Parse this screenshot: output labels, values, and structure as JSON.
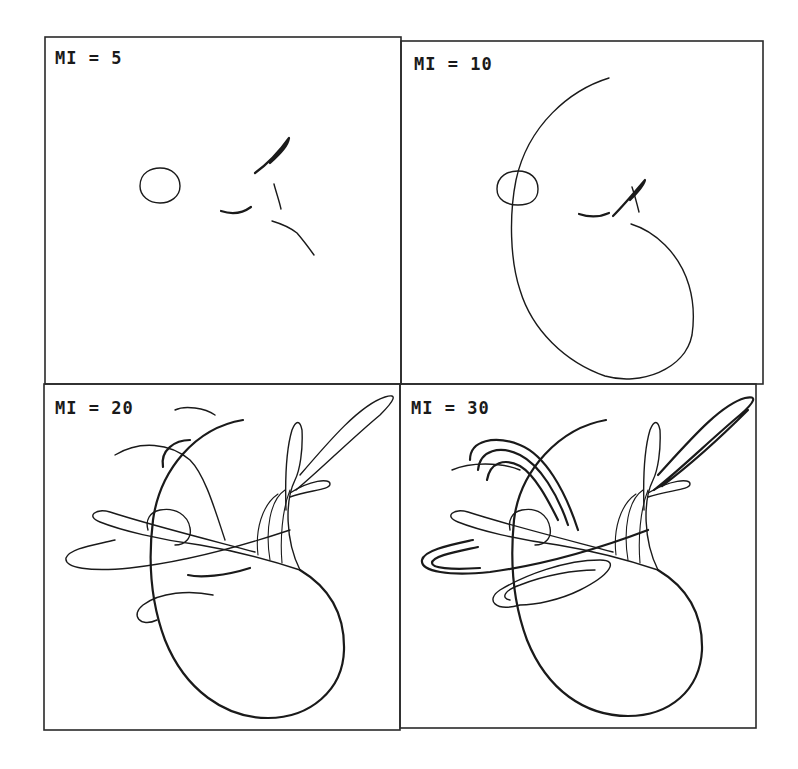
{
  "figure": {
    "background": "#ffffff",
    "ink": "#1a1a1a",
    "grid": {
      "rows": 2,
      "cols": 2
    }
  },
  "panels": [
    {
      "label": "MI = 5",
      "iterations": 5,
      "frame": {
        "x": 45,
        "y": 37,
        "w": 356,
        "h": 347
      },
      "label_pos": {
        "x": 55,
        "y": 64
      },
      "curves": [
        {
          "d": "M140,186 C140,172 152,168 160,168 C172,168 180,176 180,186 C180,197 170,203 160,203 C149,203 140,196 140,186 Z",
          "w": "normal"
        },
        {
          "d": "M255,173 C266,165 279,152 289,138 C288,145 282,152 270,163",
          "w": "thick"
        },
        {
          "d": "M274,184 C276,192 279,200 281,209",
          "w": "normal"
        },
        {
          "d": "M221,211 C230,214 240,215 251,207",
          "w": "thick"
        },
        {
          "d": "M272,221 C282,224 292,229 297,233 C303,240 309,248 314,255",
          "w": "normal"
        }
      ]
    },
    {
      "label": "MI = 10",
      "iterations": 10,
      "frame": {
        "x": 401,
        "y": 41,
        "w": 362,
        "h": 343
      },
      "label_pos": {
        "x": 414,
        "y": 70
      },
      "curves": [
        {
          "d": "M497,189 C497,176 508,171 518,171 C530,171 538,178 538,189 C538,200 530,205 518,205 C507,205 497,200 497,189 Z",
          "w": "normal"
        },
        {
          "d": "M609,78 C570,90 528,125 516,180 C509,215 510,260 520,290 C532,330 565,362 605,376 C640,386 685,370 692,335 C697,300 688,268 665,245 C655,235 644,228 631,224",
          "w": "normal"
        },
        {
          "d": "M613,216 C623,206 634,193 645,180 C644,185 640,190 630,200",
          "w": "thick"
        },
        {
          "d": "M632,187 C635,196 637,204 639,212",
          "w": "normal"
        },
        {
          "d": "M579,214 C588,217 598,218 609,213",
          "w": "thick"
        }
      ]
    },
    {
      "label": "MI = 20",
      "iterations": 20,
      "frame": {
        "x": 44,
        "y": 384,
        "w": 356,
        "h": 346
      },
      "label_pos": {
        "x": 55,
        "y": 414
      },
      "curves": [
        {
          "d": "M243,420 C195,428 160,470 153,520 C148,560 150,600 165,640 C185,690 225,718 268,718 C310,718 343,690 344,650 C345,610 325,585 300,570",
          "w": "thick"
        },
        {
          "d": "M300,570 C285,540 285,500 295,480 C300,470 303,450 302,430 C300,420 296,420 292,430 C286,450 285,480 286,510",
          "w": "normal"
        },
        {
          "d": "M296,490 C320,470 350,440 380,415 C395,400 398,393 385,397 C360,405 330,440 300,475",
          "w": "normal"
        },
        {
          "d": "M290,497 C310,490 330,490 330,484 C330,478 310,480 290,493",
          "w": "normal"
        },
        {
          "d": "M300,570 C270,560 230,550 200,545 C160,540 120,530 100,522 C85,516 96,508 110,512 C150,525 210,540 255,552",
          "w": "normal"
        },
        {
          "d": "M115,540 C95,545 70,548 66,558 C64,568 90,572 130,568 C175,563 230,550 290,530",
          "w": "normal"
        },
        {
          "d": "M157,620 C140,628 130,615 143,605 C160,592 190,590 213,595",
          "w": "normal"
        },
        {
          "d": "M188,575 C200,578 225,576 250,568",
          "w": "thick"
        },
        {
          "d": "M115,455 C140,440 170,443 190,460 C205,475 215,510 225,540",
          "w": "normal"
        },
        {
          "d": "M163,467 C160,450 175,440 190,440",
          "w": "thick"
        },
        {
          "d": "M148,530 C145,520 150,512 160,510 C175,507 188,515 190,528 C192,538 185,545 175,545",
          "w": "normal"
        },
        {
          "d": "M282,563 C280,540 282,510 290,490 M270,560 C265,530 270,500 285,490 M258,555 C255,530 262,505 278,494",
          "w": "thin"
        },
        {
          "d": "M175,410 C185,405 205,408 215,415",
          "w": "normal"
        }
      ]
    },
    {
      "label": "MI = 30",
      "iterations": 30,
      "frame": {
        "x": 400,
        "y": 384,
        "w": 356,
        "h": 344
      },
      "label_pos": {
        "x": 411,
        "y": 414
      },
      "curves": [
        {
          "d": "M606,420 C560,428 520,470 514,520 C510,560 512,600 527,640 C547,690 585,716 628,716 C670,716 700,690 702,650 C703,610 683,585 658,570",
          "w": "thick"
        },
        {
          "d": "M658,570 C643,540 643,500 653,480 C658,470 661,450 660,430 C658,420 654,420 650,430 C644,450 643,480 644,510",
          "w": "normal"
        },
        {
          "d": "M654,490 C680,470 710,440 740,415 C755,402 758,395 745,398 C720,405 690,440 658,475 M662,486 C690,465 720,438 748,410",
          "w": "thick"
        },
        {
          "d": "M648,497 C670,490 690,490 690,484 C690,478 670,480 648,493",
          "w": "normal"
        },
        {
          "d": "M658,570 C628,560 588,550 558,545 C518,540 478,530 458,522 C443,516 454,508 468,512 C508,525 568,540 613,552",
          "w": "normal"
        },
        {
          "d": "M473,540 C450,545 424,550 422,560 C420,572 450,576 490,572 C535,566 590,552 648,530 M478,547 C455,552 432,556 432,563 C432,568 450,570 480,568",
          "w": "thick"
        },
        {
          "d": "M520,605 C495,612 485,600 500,590 C525,575 565,560 600,560 C620,560 610,575 580,590 C560,600 535,605 520,605 M510,600 C500,598 505,590 520,585 C545,575 575,570 595,570",
          "w": "normal"
        },
        {
          "d": "M470,460 C470,440 495,435 520,445 C545,455 565,490 578,530 M478,470 C480,450 500,445 520,455 C540,465 558,495 568,525 M487,480 C490,462 505,458 520,466 C535,475 548,500 558,520",
          "w": "thick"
        },
        {
          "d": "M510,530 C508,520 512,512 522,510 C537,507 548,515 550,528 C552,538 545,545 535,545",
          "w": "normal"
        },
        {
          "d": "M640,563 C638,540 640,510 648,490 M628,560 C623,530 628,500 643,490 M616,555 C613,530 620,505 636,494",
          "w": "thin"
        },
        {
          "d": "M452,470 C470,462 500,462 520,470",
          "w": "normal"
        }
      ]
    }
  ]
}
